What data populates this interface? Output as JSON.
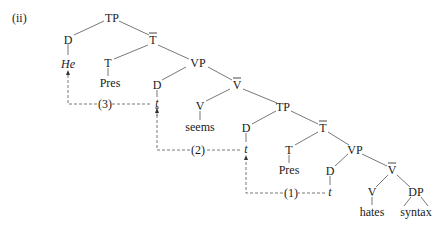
{
  "example_label": "(ii)",
  "nodes": {
    "tp_root": "TP",
    "d_subj": "D",
    "he": "He",
    "tbar_1": "T",
    "t_1": "T",
    "pres_1": "Pres",
    "vp_1": "VP",
    "d_spec_vp1": "D",
    "trace_3": "t",
    "vbar_1": "V",
    "v_1": "V",
    "seems": "seems",
    "tp_2": "TP",
    "d_spec_tp2": "D",
    "trace_2": "t",
    "tbar_2": "T",
    "t_2": "T",
    "pres_2": "Pres",
    "vp_2": "VP",
    "d_spec_vp2": "D",
    "trace_1": "t",
    "vbar_2": "V",
    "v_2": "V",
    "dp": "DP",
    "hates": "hates",
    "syntax": "syntax"
  },
  "movements": {
    "step_1": "(1)",
    "step_2": "(2)",
    "step_3": "(3)"
  }
}
